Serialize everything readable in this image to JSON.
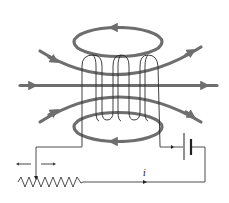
{
  "diagram": {
    "labels": {
      "current": "i"
    },
    "components": [
      {
        "name": "solenoid-coil",
        "turns": 4
      },
      {
        "name": "battery"
      },
      {
        "name": "variable-resistor"
      },
      {
        "name": "slider-direction-arrows"
      }
    ],
    "field_lines": [
      {
        "name": "upper-loop",
        "direction": "counterclockwise-left-at-top"
      },
      {
        "name": "upper-curve",
        "direction": "right"
      },
      {
        "name": "axis-line",
        "direction": "right"
      },
      {
        "name": "lower-curve",
        "direction": "right"
      },
      {
        "name": "lower-loop",
        "direction": "left-at-bottom"
      }
    ],
    "colors": {
      "field_line": "#6e6e6e",
      "wire": "#3a3a3a",
      "background": "#ffffff"
    }
  }
}
